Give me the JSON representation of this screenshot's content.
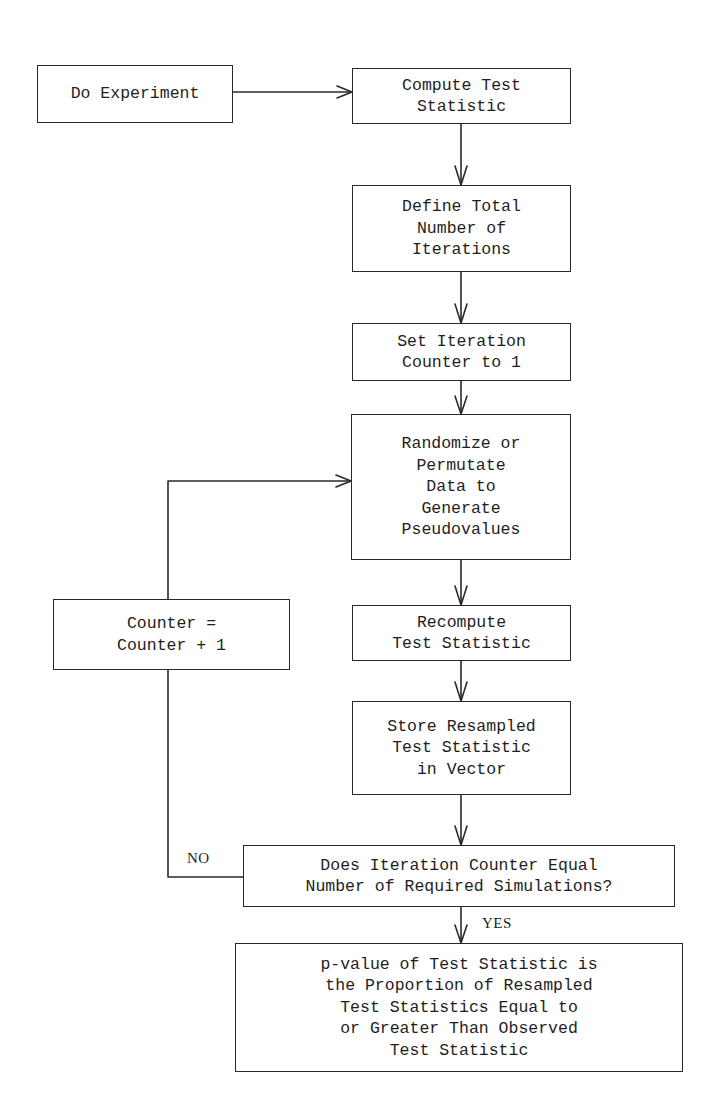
{
  "diagram": {
    "type": "flowchart",
    "title": "",
    "colors": {
      "line": "#2a2a2a",
      "text": "#1e1e1e",
      "background": "#ffffff"
    },
    "nodes": [
      {
        "id": "do_experiment",
        "text": "Do Experiment"
      },
      {
        "id": "compute_test_statistic",
        "text": "Compute Test\nStatistic"
      },
      {
        "id": "define_total_iterations",
        "text": "Define Total\nNumber of\nIterations"
      },
      {
        "id": "set_counter",
        "text": "Set Iteration\nCounter to 1"
      },
      {
        "id": "randomize",
        "text": "Randomize or\nPermutate\nData to\nGenerate\nPseudovalues"
      },
      {
        "id": "recompute",
        "text": "Recompute\nTest Statistic"
      },
      {
        "id": "store",
        "text": "Store Resampled\nTest Statistic\nin Vector"
      },
      {
        "id": "decision",
        "text": "Does Iteration Counter Equal\nNumber of Required Simulations?"
      },
      {
        "id": "increment_counter",
        "text": "Counter =\nCounter + 1"
      },
      {
        "id": "p_value",
        "text": "p-value of Test Statistic is\nthe Proportion of Resampled\nTest Statistics Equal to\nor Greater Than Observed\nTest Statistic"
      }
    ],
    "edges": [
      {
        "from": "do_experiment",
        "to": "compute_test_statistic",
        "label": ""
      },
      {
        "from": "compute_test_statistic",
        "to": "define_total_iterations",
        "label": ""
      },
      {
        "from": "define_total_iterations",
        "to": "set_counter",
        "label": ""
      },
      {
        "from": "set_counter",
        "to": "randomize",
        "label": ""
      },
      {
        "from": "randomize",
        "to": "recompute",
        "label": ""
      },
      {
        "from": "recompute",
        "to": "store",
        "label": ""
      },
      {
        "from": "store",
        "to": "decision",
        "label": ""
      },
      {
        "from": "decision",
        "to": "p_value",
        "label": "YES"
      },
      {
        "from": "decision",
        "to": "increment_counter",
        "label": "NO"
      },
      {
        "from": "increment_counter",
        "to": "randomize",
        "label": ""
      }
    ],
    "edge_labels": {
      "yes": "YES",
      "no": "NO"
    }
  }
}
